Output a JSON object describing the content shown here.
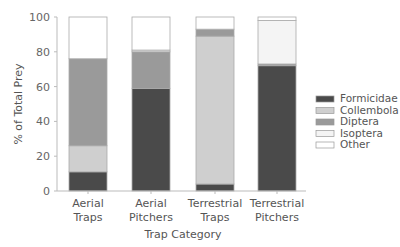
{
  "chart_data": {
    "type": "bar",
    "stacked": true,
    "title": "",
    "xlabel": "Trap Category",
    "ylabel": "% of Total Prey",
    "ylim": [
      0,
      100
    ],
    "yticks": [
      0,
      20,
      40,
      60,
      80,
      100
    ],
    "grid": false,
    "legend_position": "right",
    "categories": [
      "Aerial\nTraps",
      "Aerial\nPitchers",
      "Terrestrial\nTraps",
      "Terrestrial\nPitchers"
    ],
    "category_lines": [
      [
        "Aerial",
        "Traps"
      ],
      [
        "Aerial",
        "Pitchers"
      ],
      [
        "Terrestrial",
        "Traps"
      ],
      [
        "Terrestrial",
        "Pitchers"
      ]
    ],
    "series": [
      {
        "name": "Formicidae",
        "color": "#4a4a4a",
        "values": [
          11,
          59,
          4,
          72
        ]
      },
      {
        "name": "Collembola",
        "color": "#cfcfcf",
        "values": [
          15,
          0,
          85,
          0
        ]
      },
      {
        "name": "Diptera",
        "color": "#9a9a9a",
        "values": [
          50,
          21,
          4,
          1
        ]
      },
      {
        "name": "Isoptera",
        "color": "#f4f4f4",
        "values": [
          0,
          1,
          0,
          25
        ]
      },
      {
        "name": "Other",
        "color": "#ffffff",
        "values": [
          24,
          19,
          7,
          2
        ]
      }
    ]
  }
}
